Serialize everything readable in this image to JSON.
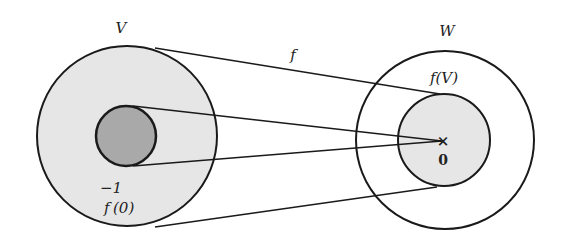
{
  "diagram": {
    "type": "mapping",
    "colors": {
      "stroke": "#1a1a1a",
      "domain_fill": "#e6e6e6",
      "preimage_fill": "#a9a9a9",
      "image_fill": "#e6e6e6",
      "background": "#ffffff"
    },
    "labels": {
      "domain": "V",
      "codomain": "W",
      "map": "f",
      "image": "f(V)",
      "preimage_base": "f",
      "preimage_sup": "−1",
      "preimage_arg": "(0)",
      "zero": "0",
      "zero_marker": "×"
    },
    "sets": [
      {
        "name": "V",
        "role": "domain",
        "shaded": true
      },
      {
        "name": "f⁻¹(0)",
        "role": "kernel / preimage of 0",
        "shaded": true
      },
      {
        "name": "W",
        "role": "codomain",
        "shaded": false
      },
      {
        "name": "f(V)",
        "role": "image",
        "shaded": true
      }
    ],
    "edges": [
      {
        "from": "V",
        "to": "f(V)",
        "label": "f"
      },
      {
        "from": "f⁻¹(0)",
        "to": "0"
      }
    ]
  }
}
